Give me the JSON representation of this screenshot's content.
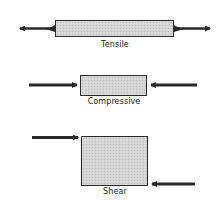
{
  "diagram": {
    "type": "stress-types",
    "panels": [
      {
        "name": "tensile",
        "label": "Tensile",
        "force_direction": "outward"
      },
      {
        "name": "compressive",
        "label": "Compressive",
        "force_direction": "inward"
      },
      {
        "name": "shear",
        "label": "Shear",
        "force_direction": "offset-opposing"
      }
    ],
    "colors": {
      "block_fill": "#d4d4d4",
      "block_border": "#2a2a2a",
      "arrow": "#2a2a2a",
      "label": "#222222"
    }
  }
}
